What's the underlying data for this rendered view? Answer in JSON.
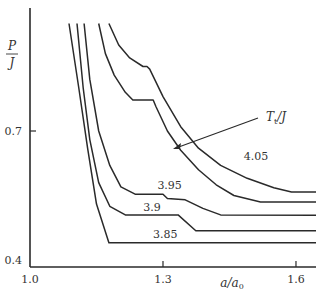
{
  "chart_data": {
    "type": "line",
    "title": "",
    "xlabel": "a/a0",
    "ylabel": "P/J",
    "xlim": [
      1.0,
      1.65
    ],
    "ylim": [
      0.4,
      0.95
    ],
    "x_ticks": [
      {
        "value": 1.0,
        "label": "1.0"
      },
      {
        "value": 1.3,
        "label": "1.3"
      },
      {
        "value": 1.6,
        "label": "1.6"
      }
    ],
    "y_ticks": [
      {
        "value": 0.4,
        "label": "0.4"
      },
      {
        "value": 0.7,
        "label": "0.7"
      }
    ],
    "grid": false,
    "legend": "none",
    "annotation": {
      "text": "Tt/J",
      "text_main": "T",
      "text_sub": "t",
      "text_suffix": "/J",
      "points_to": {
        "x": 1.325,
        "y": 0.65
      }
    },
    "series": [
      {
        "name": "3.85",
        "label": "3.85",
        "label_at": {
          "x": 1.305,
          "y": 0.452
        },
        "points": [
          [
            1.088,
            0.95
          ],
          [
            1.11,
            0.8
          ],
          [
            1.13,
            0.66
          ],
          [
            1.15,
            0.53
          ],
          [
            1.178,
            0.44
          ],
          [
            1.65,
            0.44
          ]
        ]
      },
      {
        "name": "3.9",
        "label": "3.9",
        "label_at": {
          "x": 1.275,
          "y": 0.515
        },
        "points": [
          [
            1.106,
            0.95
          ],
          [
            1.12,
            0.8
          ],
          [
            1.135,
            0.68
          ],
          [
            1.155,
            0.58
          ],
          [
            1.18,
            0.525
          ],
          [
            1.215,
            0.505
          ],
          [
            1.334,
            0.505
          ],
          [
            1.374,
            0.468
          ],
          [
            1.65,
            0.468
          ]
        ]
      },
      {
        "name": "3.95",
        "label": "3.95",
        "label_at": {
          "x": 1.315,
          "y": 0.565
        },
        "points": [
          [
            1.122,
            0.95
          ],
          [
            1.135,
            0.82
          ],
          [
            1.155,
            0.7
          ],
          [
            1.18,
            0.62
          ],
          [
            1.205,
            0.57
          ],
          [
            1.237,
            0.553
          ],
          [
            1.3,
            0.553
          ],
          [
            1.31,
            0.543
          ],
          [
            1.35,
            0.54
          ],
          [
            1.39,
            0.52
          ],
          [
            1.43,
            0.505
          ],
          [
            1.65,
            0.504
          ]
        ]
      },
      {
        "name": "4.0",
        "label": "",
        "label_at": null,
        "points": [
          [
            1.155,
            0.95
          ],
          [
            1.17,
            0.88
          ],
          [
            1.19,
            0.83
          ],
          [
            1.215,
            0.79
          ],
          [
            1.232,
            0.772
          ],
          [
            1.278,
            0.772
          ],
          [
            1.284,
            0.757
          ],
          [
            1.31,
            0.7
          ],
          [
            1.34,
            0.655
          ],
          [
            1.38,
            0.61
          ],
          [
            1.42,
            0.575
          ],
          [
            1.46,
            0.55
          ],
          [
            1.52,
            0.535
          ],
          [
            1.65,
            0.535
          ]
        ]
      },
      {
        "name": "4.05",
        "label": "4.05",
        "label_at": {
          "x": 1.51,
          "y": 0.632
        },
        "points": [
          [
            1.178,
            0.95
          ],
          [
            1.2,
            0.9
          ],
          [
            1.225,
            0.87
          ],
          [
            1.255,
            0.85
          ],
          [
            1.264,
            0.85
          ],
          [
            1.27,
            0.844
          ],
          [
            1.3,
            0.78
          ],
          [
            1.34,
            0.71
          ],
          [
            1.38,
            0.66
          ],
          [
            1.43,
            0.62
          ],
          [
            1.49,
            0.59
          ],
          [
            1.55,
            0.568
          ],
          [
            1.59,
            0.558
          ],
          [
            1.65,
            0.558
          ]
        ]
      }
    ]
  }
}
